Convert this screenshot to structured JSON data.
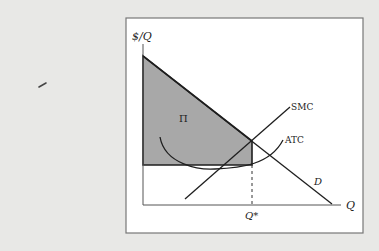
{
  "diagram": {
    "axes": {
      "y_label": "$/Q",
      "x_label": "Q",
      "x_tick_label": "Q*"
    },
    "curves": {
      "demand_label": "D",
      "smc_label": "SMC",
      "atc_label": "ATC"
    },
    "region_label": "Π",
    "colors": {
      "background": "#e8e8e6",
      "frame_fill": "#ffffff",
      "frame_stroke": "#777777",
      "profit_fill": "#a8a8a8",
      "line": "#1e1e1e"
    }
  }
}
